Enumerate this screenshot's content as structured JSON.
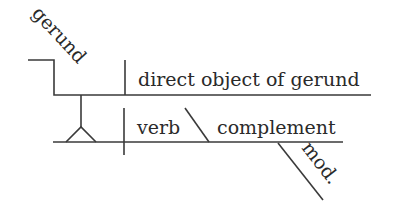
{
  "diagram": {
    "type": "sentence-diagram",
    "labels": {
      "gerund": "gerund",
      "direct_object": "direct object of gerund",
      "verb": "verb",
      "complement": "complement",
      "modifier": "mod."
    },
    "colors": {
      "line": "#3a3a3a",
      "text": "#2a2a2a",
      "background": "#ffffff"
    }
  }
}
